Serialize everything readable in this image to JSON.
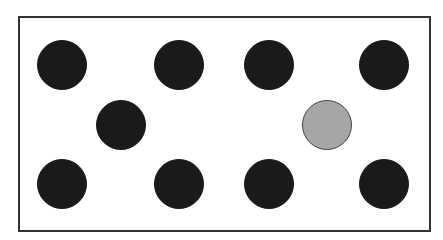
{
  "diagram": {
    "frame": {
      "left": 18,
      "top": 16,
      "width": 411,
      "height": 214
    },
    "radius": 25,
    "circles": [
      {
        "cx": 62,
        "cy": 65,
        "fill": "#1a1a1a",
        "stroke": "#1a1a1a"
      },
      {
        "cx": 179,
        "cy": 65,
        "fill": "#1a1a1a",
        "stroke": "#1a1a1a"
      },
      {
        "cx": 269,
        "cy": 65,
        "fill": "#1a1a1a",
        "stroke": "#1a1a1a"
      },
      {
        "cx": 384,
        "cy": 65,
        "fill": "#1a1a1a",
        "stroke": "#1a1a1a"
      },
      {
        "cx": 121,
        "cy": 125,
        "fill": "#1a1a1a",
        "stroke": "#1a1a1a"
      },
      {
        "cx": 327,
        "cy": 125,
        "fill": "#a6a6a6",
        "stroke": "#444444"
      },
      {
        "cx": 62,
        "cy": 184,
        "fill": "#1a1a1a",
        "stroke": "#1a1a1a"
      },
      {
        "cx": 179,
        "cy": 184,
        "fill": "#1a1a1a",
        "stroke": "#1a1a1a"
      },
      {
        "cx": 269,
        "cy": 184,
        "fill": "#1a1a1a",
        "stroke": "#1a1a1a"
      },
      {
        "cx": 384,
        "cy": 184,
        "fill": "#1a1a1a",
        "stroke": "#1a1a1a"
      }
    ]
  }
}
